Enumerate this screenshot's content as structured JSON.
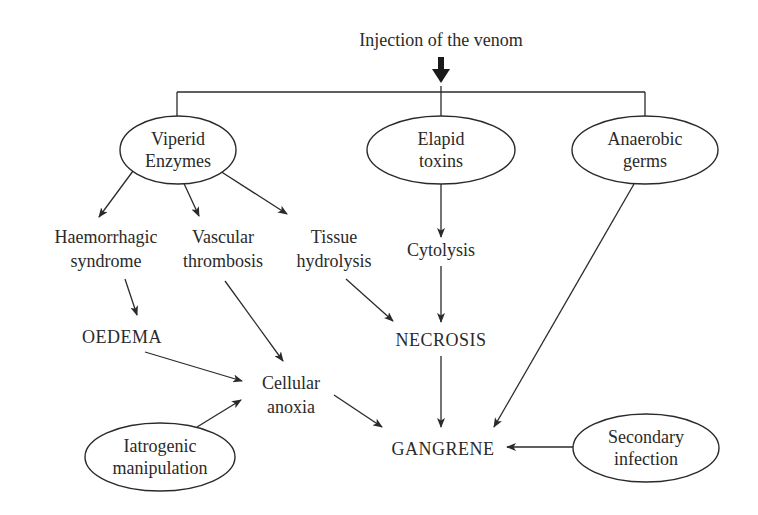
{
  "title": "Injection of the venom",
  "colors": {
    "ink": "#2a2a2a",
    "background": "#ffffff"
  },
  "nodes": {
    "viperid": {
      "lines": [
        "Viperid",
        "Enzymes"
      ],
      "shape": "ellipse"
    },
    "elapid": {
      "lines": [
        "Elapid",
        "toxins"
      ],
      "shape": "ellipse"
    },
    "anaerobic": {
      "lines": [
        "Anaerobic",
        "germs"
      ],
      "shape": "ellipse"
    },
    "haemorrhagic": {
      "lines": [
        "Haemorrhagic",
        "syndrome"
      ],
      "shape": "text"
    },
    "vascular": {
      "lines": [
        "Vascular",
        "thrombosis"
      ],
      "shape": "text"
    },
    "tissue": {
      "lines": [
        "Tissue",
        "hydrolysis"
      ],
      "shape": "text"
    },
    "cytolysis": {
      "lines": [
        "Cytolysis"
      ],
      "shape": "text"
    },
    "oedema": {
      "lines": [
        "OEDEMA"
      ],
      "shape": "text"
    },
    "necrosis": {
      "lines": [
        "NECROSIS"
      ],
      "shape": "text"
    },
    "cellular": {
      "lines": [
        "Cellular",
        "anoxia"
      ],
      "shape": "text"
    },
    "iatrogenic": {
      "lines": [
        "Iatrogenic",
        "manipulation"
      ],
      "shape": "ellipse"
    },
    "gangrene": {
      "lines": [
        "GANGRENE"
      ],
      "shape": "text"
    },
    "secondary": {
      "lines": [
        "Secondary",
        "infection"
      ],
      "shape": "ellipse"
    }
  },
  "edges": [
    {
      "from": "title",
      "to": "viperid"
    },
    {
      "from": "title",
      "to": "elapid"
    },
    {
      "from": "title",
      "to": "anaerobic"
    },
    {
      "from": "viperid",
      "to": "haemorrhagic"
    },
    {
      "from": "viperid",
      "to": "vascular"
    },
    {
      "from": "viperid",
      "to": "tissue"
    },
    {
      "from": "elapid",
      "to": "cytolysis"
    },
    {
      "from": "haemorrhagic",
      "to": "oedema"
    },
    {
      "from": "tissue",
      "to": "necrosis"
    },
    {
      "from": "cytolysis",
      "to": "necrosis"
    },
    {
      "from": "oedema",
      "to": "cellular"
    },
    {
      "from": "vascular",
      "to": "cellular"
    },
    {
      "from": "iatrogenic",
      "to": "cellular"
    },
    {
      "from": "cellular",
      "to": "gangrene"
    },
    {
      "from": "necrosis",
      "to": "gangrene"
    },
    {
      "from": "anaerobic",
      "to": "gangrene"
    },
    {
      "from": "secondary",
      "to": "gangrene"
    }
  ]
}
